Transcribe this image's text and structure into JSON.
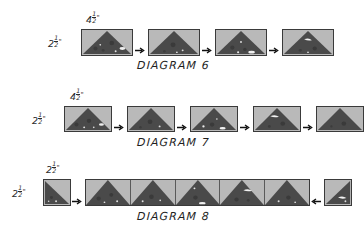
{
  "page": {
    "background_color": "#ffffff",
    "fabric_light_color": "#b9b9b9",
    "fabric_dark_color": "#4a4a4a",
    "outline_color": "#3a3a3a",
    "text_color": "#1f1f1f"
  },
  "diagrams": [
    {
      "caption": "DIAGRAM 6",
      "width_label": {
        "whole": "4",
        "numerator": "1",
        "denominator": "2",
        "unit": "\""
      },
      "height_label": {
        "whole": "2",
        "numerator": "1",
        "denominator": "2",
        "unit": "\""
      },
      "piece_count": 4,
      "piece_shape": "rectangle-with-upward-triangle",
      "arrow_count": 3,
      "arrow_direction": "right"
    },
    {
      "caption": "DIAGRAM 7",
      "width_label": {
        "whole": "4",
        "numerator": "1",
        "denominator": "2",
        "unit": "\""
      },
      "height_label": {
        "whole": "2",
        "numerator": "1",
        "denominator": "2",
        "unit": "\""
      },
      "piece_count": 5,
      "piece_shape": "rectangle-with-upward-triangle",
      "arrow_count": 4,
      "arrow_direction": "right"
    },
    {
      "caption": "DIAGRAM 8",
      "width_label": {
        "whole": "2",
        "numerator": "1",
        "denominator": "2",
        "unit": "\""
      },
      "height_label": {
        "whole": "2",
        "numerator": "1",
        "denominator": "2",
        "unit": "\""
      },
      "start_square_shape": "square-with-lower-left-triangle",
      "end_square_shape": "square-with-lower-right-triangle",
      "strip_segment_count": 5,
      "strip_segment_shape": "upward-triangle",
      "arrow_left_direction": "right",
      "arrow_right_direction": "left"
    }
  ]
}
